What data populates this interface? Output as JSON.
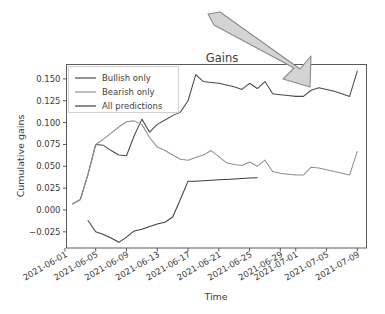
{
  "chart_data": {
    "type": "line",
    "title": "Gains",
    "xlabel": "Time",
    "ylabel": "Cumulative gains",
    "grid": false,
    "legend_position": "upper left",
    "x_tick_labels": [
      "2021-06-01",
      "2021-06-05",
      "2021-06-09",
      "2021-06-13",
      "2021-06-17",
      "2021-06-21",
      "2021-06-25",
      "2021-06-29",
      "2021-07-01",
      "2021-07-05",
      "2021-07-09"
    ],
    "x_tick_values": [
      0,
      4,
      8,
      12,
      16,
      20,
      24,
      28,
      30,
      34,
      38
    ],
    "y_tick_labels": [
      "-0.025",
      "0.000",
      "0.025",
      "0.050",
      "0.075",
      "0.100",
      "0.125",
      "0.150"
    ],
    "y_tick_values": [
      -0.025,
      0.0,
      0.025,
      0.05,
      0.075,
      0.1,
      0.125,
      0.15
    ],
    "xlim": [
      0.2,
      39.2
    ],
    "ylim": [
      -0.0435,
      0.1665
    ],
    "series": [
      {
        "name": "Bullish only",
        "color": "#4a4a4a",
        "x": [
          1,
          2,
          3,
          4,
          5,
          6,
          7,
          8,
          9,
          10,
          11,
          12,
          13,
          14,
          15,
          16,
          17,
          18,
          19,
          20,
          21,
          22,
          23,
          24,
          25,
          26,
          27,
          28,
          29,
          30,
          31,
          32,
          33,
          34,
          35,
          36,
          37,
          38
        ],
        "y": [
          0.007,
          0.012,
          0.041,
          0.075,
          0.074,
          0.068,
          0.063,
          0.062,
          0.085,
          0.104,
          0.089,
          0.098,
          0.103,
          0.108,
          0.112,
          0.125,
          0.155,
          0.147,
          0.146,
          0.145,
          0.143,
          0.141,
          0.138,
          0.145,
          0.139,
          0.147,
          0.133,
          0.132,
          0.131,
          0.13,
          0.13,
          0.137,
          0.14,
          0.138,
          0.136,
          0.133,
          0.13,
          0.159
        ]
      },
      {
        "name": "Bearish only",
        "color": "#909090",
        "x": [
          1,
          2,
          3,
          4,
          5,
          6,
          7,
          8,
          9,
          10,
          11,
          12,
          13,
          14,
          15,
          16,
          17,
          18,
          19,
          20,
          21,
          22,
          23,
          24,
          25,
          26,
          27,
          28,
          29,
          30,
          31,
          32,
          33,
          34,
          35,
          36,
          37,
          38
        ],
        "y": [
          0.007,
          0.012,
          0.041,
          0.075,
          0.081,
          0.088,
          0.095,
          0.101,
          0.102,
          0.098,
          0.083,
          0.072,
          0.068,
          0.063,
          0.058,
          0.057,
          0.06,
          0.063,
          0.068,
          0.061,
          0.054,
          0.052,
          0.051,
          0.055,
          0.05,
          0.057,
          0.044,
          0.042,
          0.041,
          0.04,
          0.04,
          0.049,
          0.048,
          0.046,
          0.044,
          0.042,
          0.04,
          0.067
        ]
      },
      {
        "name": "All predictions",
        "color": "#3f3f3f",
        "x": [
          3,
          4,
          5,
          6,
          7,
          8,
          9,
          10,
          11,
          12,
          13,
          14,
          15,
          16,
          17,
          18,
          19,
          20,
          21,
          22,
          23,
          24,
          25
        ],
        "y": [
          -0.012,
          -0.025,
          -0.028,
          -0.032,
          -0.037,
          -0.031,
          -0.024,
          -0.022,
          -0.019,
          -0.016,
          -0.014,
          -0.008,
          0.012,
          0.033,
          0.033,
          0.0335,
          0.034,
          0.0345,
          0.035,
          0.0355,
          0.036,
          0.0365,
          0.037
        ]
      }
    ]
  },
  "annotation": {
    "name": "gray-arrow",
    "color_fill": "#d4d4d4",
    "color_stroke": "#8a8a8a"
  }
}
